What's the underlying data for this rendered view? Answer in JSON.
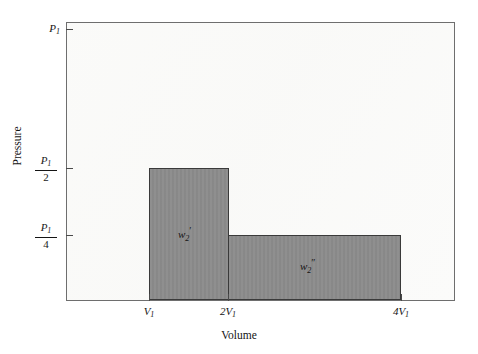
{
  "chart_data": {
    "type": "bar",
    "title": "",
    "xlabel": "Volume",
    "ylabel": "Pressure",
    "x_tick_labels": [
      "V₁",
      "2V₁",
      "4V₁"
    ],
    "y_tick_labels": [
      "P₁",
      "P₁/2",
      "P₁/4"
    ],
    "grid": false,
    "legend": false,
    "xlim": [
      0,
      5
    ],
    "ylim": [
      0,
      1
    ],
    "bars": [
      {
        "name": "w2-prime",
        "label": "w₂′",
        "x_start": "V₁",
        "x_end": "2V₁",
        "height": "P₁/2",
        "x_start_value": 1,
        "x_end_value": 2,
        "height_value": 0.5,
        "fill": "#8b8b8b",
        "edge": "#3a3a3a"
      },
      {
        "name": "w2-double-prime",
        "label": "w₂″",
        "x_start": "2V₁",
        "x_end": "4V₁",
        "height": "P₁/4",
        "x_start_value": 2,
        "x_end_value": 4,
        "height_value": 0.25,
        "fill": "#8b8b8b",
        "edge": "#3a3a3a"
      }
    ]
  },
  "axes": {
    "y_title": "Pressure",
    "x_title": "Volume",
    "y_ticks": [
      {
        "name": "p1",
        "num": "P",
        "sub": "1",
        "den": ""
      },
      {
        "name": "p1-2",
        "num": "P",
        "sub": "1",
        "den": "2"
      },
      {
        "name": "p1-4",
        "num": "P",
        "sub": "1",
        "den": "4"
      }
    ],
    "x_ticks": [
      {
        "name": "v1",
        "prefix": "",
        "var": "V",
        "sub": "1"
      },
      {
        "name": "2v1",
        "prefix": "2",
        "var": "V",
        "sub": "1"
      },
      {
        "name": "4v1",
        "prefix": "4",
        "var": "V",
        "sub": "1"
      }
    ]
  },
  "labels": {
    "p1_main": "P",
    "p1_sub": "1",
    "frac_num": "P",
    "frac_num_sub": "1",
    "den_two": "2",
    "den_four": "4",
    "v_var": "V",
    "v_sub": "1",
    "x1_prefix": "",
    "x2_prefix": "2",
    "x3_prefix": "4",
    "w_var": "w",
    "w_sub": "2",
    "prime_single": "′",
    "prime_double": "″"
  },
  "colors": {
    "bar_fill": "#8b8b8b",
    "bar_edge": "#3a3a3a",
    "frame": "#6e6e6e",
    "plot_bg": "#fbfbfa",
    "text": "#141414"
  }
}
